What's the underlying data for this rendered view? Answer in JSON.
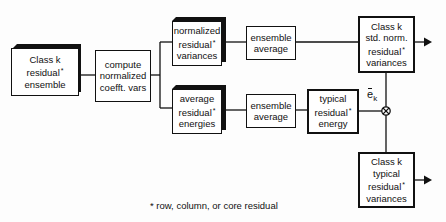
{
  "diagram": {
    "nodes": {
      "class_residual_ensemble": {
        "lines": [
          "Class k",
          "residual",
          "ensemble"
        ],
        "star_line": 1,
        "style": "3d"
      },
      "compute_normalized": {
        "lines": [
          "compute",
          "normalized",
          "coefft.  vars"
        ],
        "style": "plain"
      },
      "normalized_residual_variances": {
        "lines": [
          "normalized",
          "residual",
          "variances"
        ],
        "star_line": 1,
        "style": "3d"
      },
      "average_residual_energies": {
        "lines": [
          "average",
          "residual",
          "energies"
        ],
        "star_line": 1,
        "style": "3d"
      },
      "ensemble_average_top": {
        "lines": [
          "ensemble",
          "average"
        ],
        "style": "plain"
      },
      "ensemble_average_bottom": {
        "lines": [
          "ensemble",
          "average"
        ],
        "style": "plain"
      },
      "typical_residual_energy": {
        "lines": [
          "typical",
          "residual",
          "energy"
        ],
        "star_line": 1,
        "style": "plain"
      },
      "class_std_norm_variances": {
        "lines": [
          "Class k",
          "std.  norm.",
          "residual",
          "variances"
        ],
        "star_line": 2,
        "style": "plain-output"
      },
      "class_typical_variances": {
        "lines": [
          "Class k",
          "typical",
          "residual",
          "variances"
        ],
        "star_line": 2,
        "style": "plain-output"
      }
    },
    "multiplier": {
      "symbol": "⊗",
      "label_base": "e",
      "label_sub": "k"
    },
    "star": "*",
    "footnote": "* row, column, or core residual",
    "edges": [
      [
        "class_residual_ensemble",
        "compute_normalized"
      ],
      [
        "compute_normalized",
        "normalized_residual_variances"
      ],
      [
        "compute_normalized",
        "average_residual_energies"
      ],
      [
        "normalized_residual_variances",
        "ensemble_average_top"
      ],
      [
        "average_residual_energies",
        "ensemble_average_bottom"
      ],
      [
        "ensemble_average_top",
        "class_std_norm_variances"
      ],
      [
        "ensemble_average_bottom",
        "typical_residual_energy"
      ],
      [
        "typical_residual_energy",
        "multiplier"
      ],
      [
        "class_std_norm_variances",
        "multiplier"
      ],
      [
        "multiplier",
        "class_typical_variances"
      ]
    ],
    "colors": {
      "ink": "#111111",
      "paper": "#ffffff"
    }
  }
}
